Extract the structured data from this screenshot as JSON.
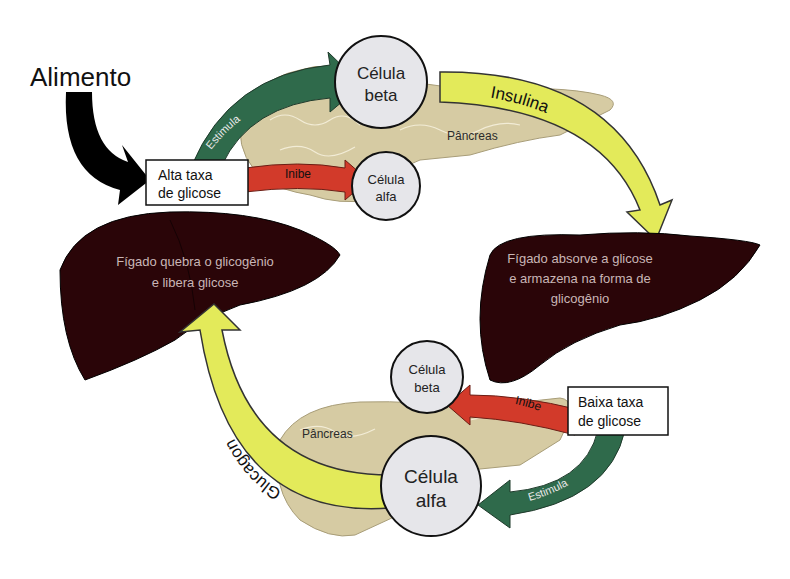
{
  "title": "Alimento",
  "colors": {
    "liver": "#2a0508",
    "liver_text": "#c9b6b6",
    "pancreas": "#d6cba3",
    "pancreas_line": "#f2ecd6",
    "cell_fill": "#e6e6ea",
    "insulin_arrow": "#e3ea5a",
    "stimulate_arrow": "#2f6a4b",
    "inhibit_arrow": "#d23a2a",
    "food_arrow": "#000000"
  },
  "top": {
    "food_label": "Alimento",
    "high_glucose_box": [
      "Alta taxa",
      "de glicose"
    ],
    "stimulate_label": "Estimula",
    "inhibit_label": "Inibe",
    "beta_cell": [
      "Célula",
      "beta"
    ],
    "alpha_cell": [
      "Célula",
      "alfa"
    ],
    "pancreas_label": "Pâncreas",
    "hormone_label": "Insulina"
  },
  "left_liver": {
    "text": [
      "Fígado quebra o glicogênio",
      "e libera glicose"
    ]
  },
  "right_liver": {
    "text": [
      "Fígado absorve a glicose",
      "e armazena na forma de",
      "glicogênio"
    ]
  },
  "bottom": {
    "low_glucose_box": [
      "Baixa taxa",
      "de glicose"
    ],
    "stimulate_label": "Estimula",
    "inhibit_label": "Inibe",
    "beta_cell": [
      "Célula",
      "beta"
    ],
    "alpha_cell": [
      "Célula",
      "alfa"
    ],
    "pancreas_label": "Pâncreas",
    "hormone_label": "Glucagon"
  }
}
